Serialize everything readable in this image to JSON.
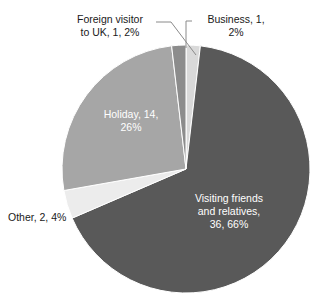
{
  "chart_data": {
    "type": "pie",
    "title": "",
    "categories": [
      "Business",
      "Visiting friends and relatives",
      "Other",
      "Holiday",
      "Foreign visitor to UK"
    ],
    "values": [
      1,
      36,
      2,
      14,
      1
    ],
    "percentages": [
      2,
      66,
      4,
      26,
      2
    ],
    "total": 54,
    "legend_position": "none",
    "grid": false,
    "start_angle_deg": 0,
    "direction": "clockwise",
    "slices": [
      {
        "name": "Business",
        "value": 1,
        "percent": 2,
        "color": "#d9d9d9",
        "label_text": "Business, 1,\n2%",
        "label_placement": "outside",
        "label_color": "#1a1a1a",
        "leader_line": true
      },
      {
        "name": "Visiting friends and relatives",
        "value": 36,
        "percent": 66,
        "color": "#595959",
        "label_text": "Visiting friends\nand relatives,\n36, 66%",
        "label_placement": "inside",
        "label_color": "#ffffff",
        "leader_line": false
      },
      {
        "name": "Other",
        "value": 2,
        "percent": 4,
        "color": "#ececec",
        "label_text": "Other, 2, 4%",
        "label_placement": "outside",
        "label_color": "#1a1a1a",
        "leader_line": false
      },
      {
        "name": "Holiday",
        "value": 14,
        "percent": 26,
        "color": "#a6a6a6",
        "label_text": "Holiday, 14,\n26%",
        "label_placement": "inside",
        "label_color": "#ffffff",
        "leader_line": false
      },
      {
        "name": "Foreign visitor to UK",
        "value": 1,
        "percent": 2,
        "color": "#8c8c8c",
        "label_text": "Foreign visitor\nto UK, 1, 2%",
        "label_placement": "outside",
        "label_color": "#1a1a1a",
        "leader_line": true
      }
    ],
    "geometry": {
      "center_x": 186,
      "center_y": 169,
      "radius": 124
    }
  },
  "labels": {
    "foreign_visitor": "Foreign visitor\nto UK, 1, 2%",
    "business": "Business, 1,\n2%",
    "holiday": "Holiday, 14,\n26%",
    "other": "Other, 2, 4%",
    "visiting_friends": "Visiting friends\nand relatives,\n36, 66%"
  },
  "colors": {
    "business": "#d9d9d9",
    "visiting_friends": "#595959",
    "other": "#ececec",
    "holiday": "#a6a6a6",
    "foreign_visitor": "#8c8c8c",
    "background": "#ffffff",
    "leader_line": "#8a8a8a",
    "slice_outline": "#ffffff"
  }
}
